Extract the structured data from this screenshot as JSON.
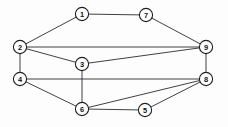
{
  "figure": {
    "background_color": "#fdfdfd",
    "edge_color": "#2b2b2b",
    "node_fill_color": "#ffffff",
    "node_stroke_color": "#1f1f1f",
    "label_color": "#101010",
    "width": 228,
    "height": 127
  },
  "graph": {
    "node_radius": 6.6,
    "nodes": [
      {
        "id": "1",
        "label": "1",
        "x": 82,
        "y": 14
      },
      {
        "id": "2",
        "label": "2",
        "x": 20,
        "y": 47
      },
      {
        "id": "3",
        "label": "3",
        "x": 82,
        "y": 64
      },
      {
        "id": "4",
        "label": "4",
        "x": 20,
        "y": 79
      },
      {
        "id": "5",
        "label": "5",
        "x": 145,
        "y": 110
      },
      {
        "id": "6",
        "label": "6",
        "x": 82,
        "y": 109
      },
      {
        "id": "7",
        "label": "7",
        "x": 146,
        "y": 15
      },
      {
        "id": "8",
        "label": "8",
        "x": 206,
        "y": 79
      },
      {
        "id": "9",
        "label": "9",
        "x": 206,
        "y": 47
      }
    ],
    "edges": [
      {
        "source": "1",
        "target": "2"
      },
      {
        "source": "1",
        "target": "7"
      },
      {
        "source": "7",
        "target": "9"
      },
      {
        "source": "2",
        "target": "9"
      },
      {
        "source": "2",
        "target": "3"
      },
      {
        "source": "2",
        "target": "4"
      },
      {
        "source": "3",
        "target": "9"
      },
      {
        "source": "3",
        "target": "6"
      },
      {
        "source": "4",
        "target": "8"
      },
      {
        "source": "4",
        "target": "6"
      },
      {
        "source": "9",
        "target": "8"
      },
      {
        "source": "6",
        "target": "5"
      },
      {
        "source": "6",
        "target": "8"
      },
      {
        "source": "5",
        "target": "8"
      }
    ]
  }
}
